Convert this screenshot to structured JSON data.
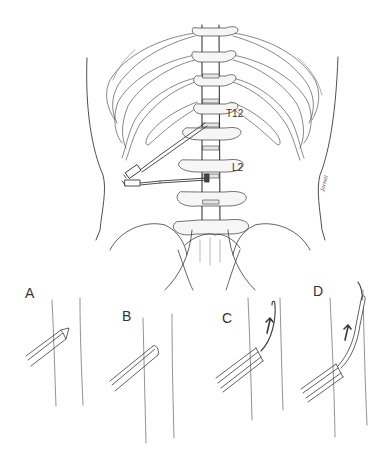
{
  "figure": {
    "type": "anatomical-illustration",
    "vertebra_labels": [
      {
        "text": "T12",
        "x": 226,
        "y": 114
      },
      {
        "text": "L2",
        "x": 232,
        "y": 167
      }
    ],
    "panel_labels": [
      {
        "text": "A",
        "x": 25,
        "y": 293
      },
      {
        "text": "B",
        "x": 122,
        "y": 316
      },
      {
        "text": "C",
        "x": 222,
        "y": 318
      },
      {
        "text": "D",
        "x": 313,
        "y": 290
      }
    ],
    "signature": "Jarrell",
    "colors": {
      "line": "#3a3a3a",
      "light_line": "#9a9a9a",
      "shade": "#e6e6e6",
      "background": "#ffffff"
    }
  }
}
